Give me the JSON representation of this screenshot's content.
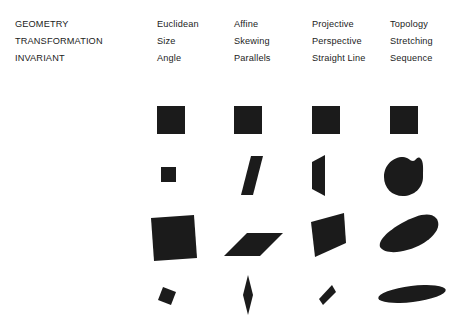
{
  "diagram": {
    "ink_color": "#1b1b1b",
    "background_color": "#ffffff"
  },
  "row_labels": {
    "geometry": "GEOMETRY",
    "transformation": "TRANSFORMATION",
    "invariant": "INVARIANT"
  },
  "columns": [
    {
      "geometry": "Euclidean",
      "transformation": "Size",
      "invariant": "Angle",
      "shapes": [
        "square",
        "small-square",
        "large-rotated-square",
        "tiny-rotated-square"
      ]
    },
    {
      "geometry": "Affine",
      "transformation": "Skewing",
      "invariant": "Parallels",
      "shapes": [
        "square",
        "parallelogram",
        "flat-parallelogram",
        "thin-diamond"
      ]
    },
    {
      "geometry": "Projective",
      "transformation": "Perspective",
      "invariant": "Straight Line",
      "shapes": [
        "square",
        "trapezoid",
        "irregular-quadrilateral",
        "thin-sliver-quadrilateral"
      ]
    },
    {
      "geometry": "Topology",
      "transformation": "Stretching",
      "invariant": "Sequence",
      "shapes": [
        "square",
        "round-blob",
        "elongated-blob",
        "flat-ellipse"
      ]
    }
  ]
}
